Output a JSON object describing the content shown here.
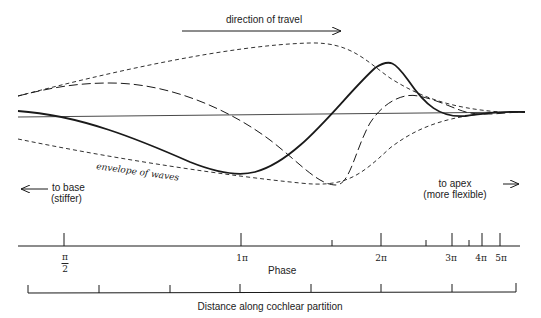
{
  "annotations": {
    "direction_of_travel": "direction of travel",
    "envelope": "envelope of waves",
    "to_base_line1": "to base",
    "to_base_line2": "(stiffer)",
    "to_apex_line1": "to apex",
    "to_apex_line2": "(more flexible)"
  },
  "phase_axis": {
    "label": "Phase",
    "ticks": [
      {
        "label_num": "π",
        "label_den": "2",
        "x": 64,
        "major": true
      },
      {
        "label": "1π",
        "x": 241,
        "major": true
      },
      {
        "label": "",
        "x": 332,
        "major": false
      },
      {
        "label": "2π",
        "x": 381,
        "major": true
      },
      {
        "label": "",
        "x": 426,
        "major": false
      },
      {
        "label": "3π",
        "x": 452,
        "major": true
      },
      {
        "label": "",
        "x": 469,
        "major": false
      },
      {
        "label": "4π",
        "x": 482,
        "major": true
      },
      {
        "label": "5π",
        "x": 500,
        "major": true
      }
    ]
  },
  "distance_axis": {
    "label": "Distance along cochlear partition",
    "tick_count": 8
  },
  "labels": {
    "pi_half_num": "π",
    "pi_half_den": "2",
    "one_pi": "1π",
    "two_pi": "2π",
    "three_pi": "3π",
    "four_pi": "4π",
    "five_pi": "5π"
  },
  "colors": {
    "ink": "#1a1a1a",
    "background": "#ffffff"
  }
}
